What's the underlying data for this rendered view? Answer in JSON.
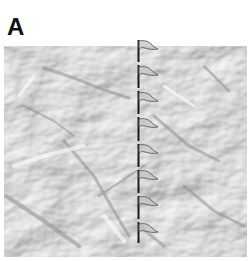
{
  "figure": {
    "panel_label": "A",
    "colors": {
      "background": "#ffffff",
      "paper_light": "#f4f4f4",
      "paper_shadow": "#9a9a9a",
      "pole": "#1a1a1a",
      "flag_outline": "#555555",
      "flag_fill": "#bdbdbd"
    },
    "pole": {
      "x": 138,
      "y_top": 40,
      "y_bottom": 243
    },
    "flags": [
      {
        "index": 1,
        "y": 41
      },
      {
        "index": 2,
        "y": 67
      },
      {
        "index": 3,
        "y": 93
      },
      {
        "index": 4,
        "y": 119
      },
      {
        "index": 5,
        "y": 145
      },
      {
        "index": 6,
        "y": 171
      },
      {
        "index": 7,
        "y": 197
      },
      {
        "index": 8,
        "y": 224
      }
    ],
    "flag_count": 8
  }
}
